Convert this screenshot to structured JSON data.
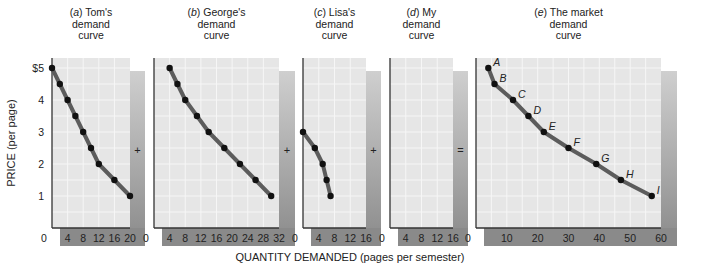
{
  "figure": {
    "ylabel": "PRICE (per page)",
    "xlabel": "QUANTITY DEMANDED (pages per semester)",
    "y_ticks": [
      "1",
      "2",
      "3",
      "4",
      "$5"
    ],
    "operators": [
      "+",
      "+",
      "+",
      "="
    ],
    "colors": {
      "plot_bg": "#e6e6e6",
      "grid": "#f6f6f6",
      "curve": "#5c5c5c",
      "dot": "#111111",
      "axis": "#333333",
      "shade_light": "#cfcfcf",
      "shade_dark": "#8a8a8a"
    }
  },
  "chart_data": [
    {
      "type": "line",
      "title_prefix": "(a)",
      "title": "Tom's demand curve",
      "title_lines": [
        "Tom's",
        "demand",
        "curve"
      ],
      "xlabel": "QUANTITY DEMANDED (pages per semester)",
      "ylabel": "PRICE (per page)",
      "xlim": [
        0,
        20
      ],
      "ylim": [
        0,
        5
      ],
      "x_ticks": [
        4,
        8,
        12,
        16,
        20
      ],
      "points": [
        [
          0,
          5
        ],
        [
          2,
          4.5
        ],
        [
          4,
          4
        ],
        [
          6,
          3.5
        ],
        [
          8,
          3
        ],
        [
          10,
          2.5
        ],
        [
          12,
          2
        ],
        [
          16,
          1.5
        ],
        [
          20,
          1
        ]
      ]
    },
    {
      "type": "line",
      "title_prefix": "(b)",
      "title": "George's demand curve",
      "title_lines": [
        "George's",
        "demand",
        "curve"
      ],
      "xlim": [
        0,
        32
      ],
      "ylim": [
        0,
        5
      ],
      "x_ticks": [
        4,
        8,
        12,
        16,
        20,
        24,
        28,
        32
      ],
      "points": [
        [
          4,
          5
        ],
        [
          6,
          4.5
        ],
        [
          8,
          4
        ],
        [
          11,
          3.5
        ],
        [
          14,
          3
        ],
        [
          18,
          2.5
        ],
        [
          22,
          2
        ],
        [
          26,
          1.5
        ],
        [
          30,
          1
        ]
      ]
    },
    {
      "type": "line",
      "title_prefix": "(c)",
      "title": "Lisa's demand curve",
      "title_lines": [
        "Lisa's",
        "demand",
        "curve"
      ],
      "xlim": [
        0,
        16
      ],
      "ylim": [
        0,
        5
      ],
      "x_ticks": [
        4,
        8,
        12,
        16
      ],
      "points": [
        [
          0,
          3
        ],
        [
          3,
          2.5
        ],
        [
          5,
          2
        ],
        [
          6,
          1.5
        ],
        [
          7,
          1
        ]
      ]
    },
    {
      "type": "line",
      "title_prefix": "(d)",
      "title": "My demand curve",
      "title_lines": [
        "My",
        "demand",
        "curve"
      ],
      "xlim": [
        0,
        16
      ],
      "ylim": [
        0,
        5
      ],
      "x_ticks": [
        4,
        8,
        12,
        16
      ],
      "points": []
    },
    {
      "type": "line",
      "title_prefix": "(e)",
      "title": "The market demand curve",
      "title_lines": [
        "The market",
        "demand",
        "curve"
      ],
      "xlim": [
        0,
        60
      ],
      "ylim": [
        0,
        5
      ],
      "x_ticks": [
        10,
        20,
        30,
        40,
        50,
        60
      ],
      "points": [
        [
          4,
          5
        ],
        [
          6,
          4.5
        ],
        [
          12,
          4
        ],
        [
          17,
          3.5
        ],
        [
          22,
          3
        ],
        [
          30,
          2.5
        ],
        [
          39,
          2
        ],
        [
          47,
          1.5
        ],
        [
          57,
          1
        ]
      ],
      "point_labels": [
        "A",
        "B",
        "C",
        "D",
        "E",
        "F",
        "G",
        "H",
        "I"
      ]
    }
  ]
}
